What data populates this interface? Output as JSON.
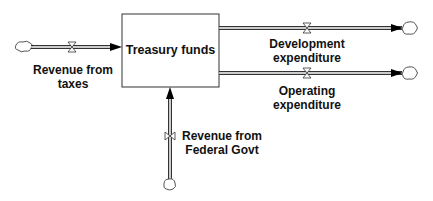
{
  "diagram": {
    "type": "stock-and-flow",
    "stock": {
      "label": "Treasury funds"
    },
    "flows": [
      {
        "id": "revenue_taxes",
        "line1": "Revenue from",
        "line2": "taxes",
        "direction": "inflow",
        "from": "cloud",
        "to": "Treasury funds"
      },
      {
        "id": "revenue_federal",
        "line1": "Revenue from",
        "line2": "Federal Govt",
        "direction": "inflow",
        "from": "cloud",
        "to": "Treasury funds"
      },
      {
        "id": "development_exp",
        "line1": "Development",
        "line2": "expenditure",
        "direction": "outflow",
        "from": "Treasury funds",
        "to": "cloud"
      },
      {
        "id": "operating_exp",
        "line1": "Operating",
        "line2": "expenditure",
        "direction": "outflow",
        "from": "Treasury funds",
        "to": "cloud"
      }
    ],
    "colors": {
      "line": "#222222",
      "pipe_fill": "#ffffff",
      "cloud": "#555555"
    }
  }
}
